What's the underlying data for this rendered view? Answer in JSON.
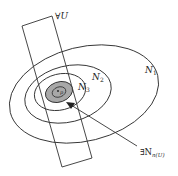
{
  "diagram": {
    "labels": {
      "forall_u": "∀U",
      "n1": "N",
      "n1_sub": "1",
      "n2": "N",
      "n2_sub": "2",
      "n3": "N",
      "n3_sub": "3",
      "p": "p",
      "exists_prefix": "∃N",
      "exists_sub": "n(U)"
    },
    "colors": {
      "stroke": "#333333",
      "shaded": "#a8a8a8",
      "background": "#ffffff"
    }
  }
}
